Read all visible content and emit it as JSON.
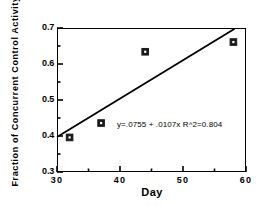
{
  "chart_data": {
    "type": "scatter",
    "title": "",
    "subtitle": "",
    "xlabel": "Day",
    "ylabel": "Fraction of Concurrent Control Activity",
    "xlim": [
      30,
      60
    ],
    "ylim": [
      0.3,
      0.7
    ],
    "grid": false,
    "legend": null,
    "legend_position": "none",
    "x_major_ticks": [
      30,
      40,
      50,
      60
    ],
    "x_major_tick_labels": [
      "30",
      "40",
      "50",
      "60"
    ],
    "x_minor_ticks": [
      35,
      45,
      55
    ],
    "y_major_ticks": [
      0.3,
      0.4,
      0.5,
      0.6,
      0.7
    ],
    "y_major_tick_labels": [
      "0.3",
      "0.4",
      "0.5",
      "0.6",
      "0.7"
    ],
    "y_minor_ticks": [
      0.35,
      0.45,
      0.55,
      0.65
    ],
    "series": [
      {
        "name": "Observed",
        "marker": "filled-square",
        "color": "#1a1a1a",
        "points": [
          {
            "x": 32,
            "y": 0.396
          },
          {
            "x": 37,
            "y": 0.436
          },
          {
            "x": 44,
            "y": 0.634
          },
          {
            "x": 58,
            "y": 0.661
          }
        ]
      },
      {
        "name": "Regression line",
        "type": "line",
        "color": "#000000",
        "intercept": 0.0755,
        "slope": 0.0107,
        "r_squared": 0.804,
        "x_start": 30,
        "y_start": 0.397,
        "x_end": 58.2,
        "y_end": 0.698
      }
    ],
    "annotations": [
      {
        "text": "y=.0755 + .0107x  R^2=0.804",
        "x": 44,
        "y": 0.452
      }
    ]
  },
  "axis": {
    "x_title": "Day",
    "y_title": "Fraction of Concurrent Control Activity"
  },
  "annotation_text": "y=.0755 + .0107x  R^2=0.804"
}
